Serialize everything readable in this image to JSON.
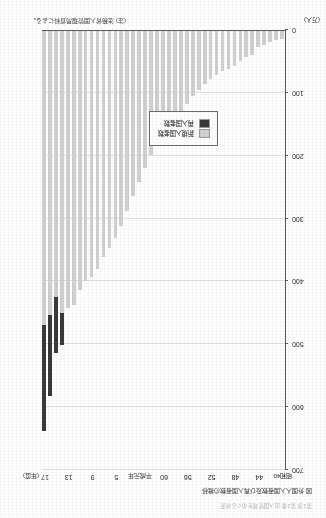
{
  "page": {
    "running_header": "第1部 第2章 出入国管理をめぐる状況",
    "unit_note": "(注) 法務省入国管理局資料による。"
  },
  "chart_data": {
    "type": "bar",
    "stacked": true,
    "title": "図 外国人入国者数及び再入国者数の推移",
    "xlabel": "(年度)",
    "ylabel": "(万人)",
    "ylim": [
      0,
      700
    ],
    "yticks": [
      0,
      100,
      200,
      300,
      400,
      500,
      600,
      700
    ],
    "grid": true,
    "legend_position": "bottom-right",
    "x_tick_labels": [
      {
        "index": 0,
        "label": "昭和40"
      },
      {
        "index": 4,
        "label": "44"
      },
      {
        "index": 8,
        "label": "48"
      },
      {
        "index": 12,
        "label": "52"
      },
      {
        "index": 16,
        "label": "56"
      },
      {
        "index": 20,
        "label": "60"
      },
      {
        "index": 24,
        "label": "平成元年"
      },
      {
        "index": 28,
        "label": "5"
      },
      {
        "index": 32,
        "label": "9"
      },
      {
        "index": 36,
        "label": "13"
      },
      {
        "index": 40,
        "label": "17"
      }
    ],
    "categories": [
      "昭和40",
      "41",
      "42",
      "43",
      "44",
      "45",
      "46",
      "47",
      "48",
      "49",
      "50",
      "51",
      "52",
      "53",
      "54",
      "55",
      "56",
      "57",
      "58",
      "59",
      "60",
      "61",
      "62",
      "63",
      "平成元年",
      "2",
      "3",
      "4",
      "5",
      "6",
      "7",
      "8",
      "9",
      "10",
      "11",
      "12",
      "13",
      "14",
      "15",
      "16",
      "17"
    ],
    "series": [
      {
        "name": "新規入国者数",
        "color": "#d2d2d2",
        "values": [
          12,
          15,
          18,
          22,
          26,
          38,
          42,
          48,
          56,
          60,
          64,
          70,
          76,
          84,
          94,
          104,
          116,
          128,
          140,
          152,
          166,
          182,
          198,
          218,
          240,
          262,
          286,
          310,
          330,
          346,
          360,
          378,
          392,
          398,
          412,
          436,
          440,
          448,
          424,
          452,
          468
        ]
      },
      {
        "name": "再入国者数",
        "color": "#3a3a3a",
        "values": [
          0,
          0,
          0,
          0,
          0,
          0,
          0,
          0,
          0,
          0,
          0,
          0,
          0,
          0,
          0,
          0,
          0,
          0,
          0,
          0,
          0,
          0,
          0,
          0,
          0,
          0,
          0,
          0,
          0,
          0,
          0,
          0,
          0,
          0,
          0,
          0,
          0,
          52,
          88,
          128,
          168
        ]
      }
    ]
  }
}
